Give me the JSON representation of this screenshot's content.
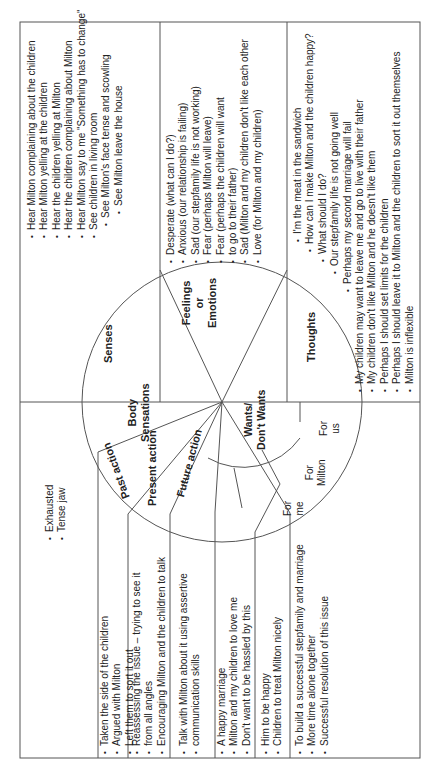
{
  "diagram": {
    "orientation": "rotated 90 degrees counter-clockwise",
    "wheel": {
      "segments": {
        "senses": "Senses",
        "feelings": [
          "Feelings",
          "or",
          "Emotions"
        ],
        "thoughts": "Thoughts",
        "body_sensations": [
          "Body",
          "Sensations"
        ],
        "past_action": "Past action",
        "present_action": "Present action",
        "future_action": "Future action",
        "wants": [
          "Wants/",
          "Don't Wants"
        ],
        "for_me": [
          "For",
          "me"
        ],
        "for_milton": [
          "For",
          "Milton"
        ],
        "for_us": [
          "For",
          "us"
        ]
      }
    },
    "senses_items": [
      "Hear Milton complaining about the children",
      "Hear Milton yelling at the children",
      "Hear the children yelling at Milton",
      "Hear the children complaining about Milton",
      "Hear Milton say to me \"Something has to change\"",
      "See children in living room",
      "See Milton's face tense and scowling",
      "See Milton leave the house"
    ],
    "feelings_items": [
      "Desperate (what can I do?)",
      "Anxious (our relationship is failing)",
      "Sad (our stepfamily life is not working)",
      "Fear (perhaps Milton will leave)",
      "Fear (perhaps the children will want",
      "to go to their father)",
      "Sad (Milton and my children don't like each other",
      "Love (for Milton and my children)"
    ],
    "thoughts_items": [
      "I'm the meat in the sandwich",
      "How can I make Milton and the children happy?",
      "What should I do?",
      "Our stepfamily life is not going well",
      "Perhaps my second marriage will fail",
      "My children may want to leave me and go to live with their father",
      "My children don't like Milton and he doesn't like them",
      "Perhaps I should set limits for the children",
      "Perhaps I should leave it to Milton and the children to sort it out themselves",
      "Milton is inflexible"
    ],
    "body_items": [
      "Exhausted",
      "Tense jaw"
    ],
    "past_action_items": [
      "Taken the side of the children",
      "Argued with Milton",
      "Left them to sort it out"
    ],
    "present_action_items": [
      "Reassessing the issue – trying to see it",
      "from all angles",
      "Encouraging Milton and the children to talk"
    ],
    "future_action_items": [
      "Talk with Milton about it using assertive",
      "communication skills"
    ],
    "wants_me_items": [
      "A happy marriage",
      "Milton and my children to love me",
      "Don't want to be hassled by this"
    ],
    "wants_milton_items": [
      "Him to be happy",
      "Children to treat Milton nicely"
    ],
    "wants_us_items": [
      "To build a successful stepfamily and marriage",
      "More time alone together",
      "Successful resolution of this issue"
    ]
  }
}
